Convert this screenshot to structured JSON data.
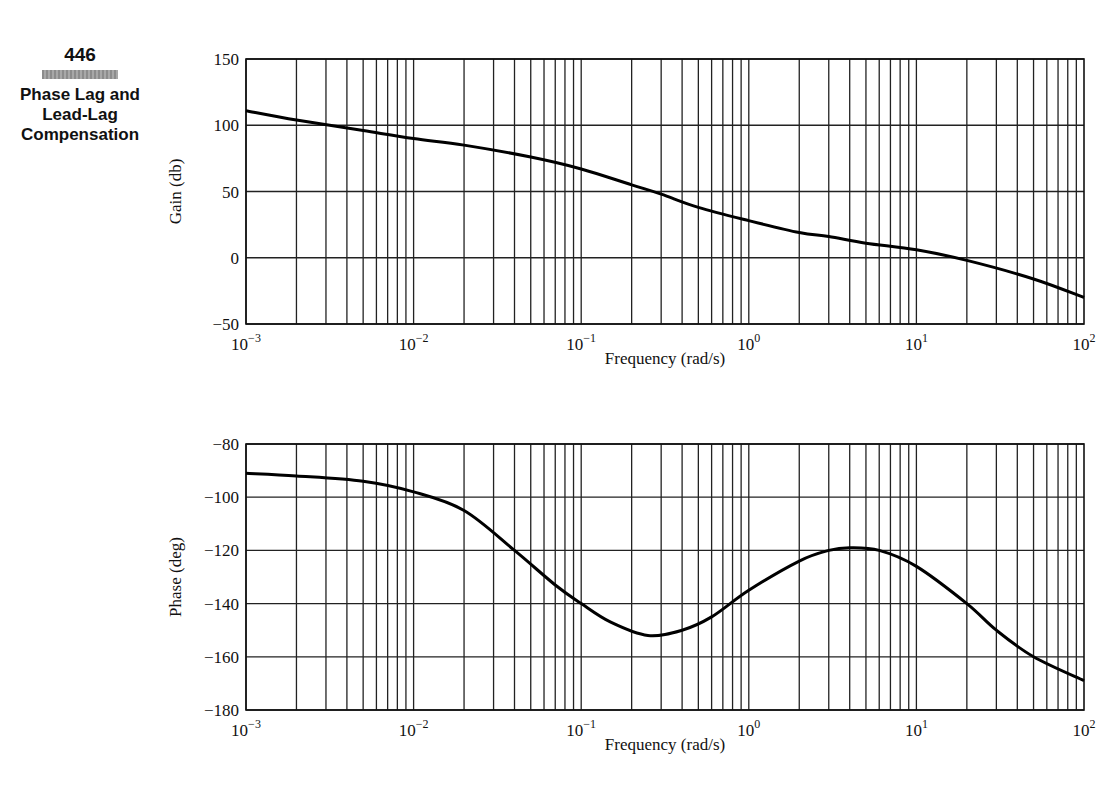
{
  "sidebar": {
    "page_number": "446",
    "section_title_lines": [
      "Phase Lag and",
      "Lead-Lag",
      "Compensation"
    ]
  },
  "chart_data": [
    {
      "type": "line",
      "title": "",
      "xlabel": "Frequency (rad/s)",
      "ylabel": "Gain (db)",
      "xscale": "log",
      "xlim": [
        0.001,
        100
      ],
      "ylim": [
        -50,
        150
      ],
      "x_tick_labels": [
        "10^-3",
        "10^-2",
        "10^-1",
        "10^0",
        "10^1",
        "10^2"
      ],
      "y_tick_labels": [
        "150",
        "100",
        "50",
        "0",
        "-50"
      ],
      "grid": true,
      "series": [
        {
          "name": "Gain",
          "x": [
            0.001,
            0.002,
            0.005,
            0.01,
            0.02,
            0.05,
            0.1,
            0.2,
            0.3,
            0.5,
            1,
            2,
            3,
            5,
            10,
            20,
            50,
            100
          ],
          "values": [
            111,
            104,
            96,
            90,
            85,
            76,
            67,
            55,
            48,
            38,
            28,
            19,
            16,
            11,
            6,
            -2,
            -16,
            -30
          ]
        }
      ]
    },
    {
      "type": "line",
      "title": "",
      "xlabel": "Frequency (rad/s)",
      "ylabel": "Phase (deg)",
      "xscale": "log",
      "xlim": [
        0.001,
        100
      ],
      "ylim": [
        -180,
        -80
      ],
      "x_tick_labels": [
        "10^-3",
        "10^-2",
        "10^-1",
        "10^0",
        "10^1",
        "10^2"
      ],
      "y_tick_labels": [
        "-80",
        "-100",
        "-120",
        "-140",
        "-160",
        "-180"
      ],
      "grid": true,
      "series": [
        {
          "name": "Phase",
          "x": [
            0.001,
            0.002,
            0.005,
            0.01,
            0.02,
            0.04,
            0.07,
            0.1,
            0.15,
            0.25,
            0.4,
            0.6,
            1,
            2,
            3,
            4,
            6,
            10,
            20,
            30,
            50,
            100
          ],
          "values": [
            -91,
            -92,
            -94,
            -98,
            -105,
            -120,
            -133,
            -140,
            -147,
            -152,
            -150,
            -145,
            -135,
            -124,
            -120,
            -119,
            -120,
            -126,
            -140,
            -150,
            -160,
            -169
          ]
        }
      ]
    }
  ]
}
